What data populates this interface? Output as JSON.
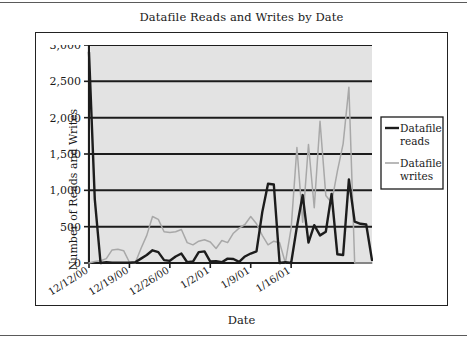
{
  "chart_data": {
    "type": "line",
    "title": "Datafile Reads and Writes by Date",
    "xlabel": "Date",
    "ylabel": "Number of Reads and Writes",
    "ylim": [
      0,
      3000
    ],
    "ytick_labels": [
      "0",
      "500",
      "1,000",
      "1,500",
      "2,000",
      "2,500",
      "3,000"
    ],
    "ytick_values": [
      0,
      500,
      1000,
      1500,
      2000,
      2500,
      3000
    ],
    "xtick_labels": [
      "12/12/00",
      "12/19/00",
      "12/26/00",
      "1/2/01",
      "1/9/01",
      "1/16/01"
    ],
    "xtick_indices": [
      0,
      7,
      14,
      21,
      28,
      35
    ],
    "grid": "horizontal",
    "legend_position": "right",
    "plot_background": "#e3e3e3",
    "series": [
      {
        "name": "Datafile reads",
        "color": "#1c1c1c",
        "values": [
          2900,
          880,
          0,
          10,
          5,
          5,
          5,
          5,
          10,
          60,
          110,
          175,
          150,
          40,
          30,
          90,
          130,
          10,
          20,
          150,
          160,
          20,
          25,
          10,
          60,
          55,
          15,
          90,
          130,
          160,
          700,
          1090,
          1080,
          0,
          10,
          0,
          500,
          935,
          280,
          520,
          380,
          430,
          950,
          120,
          110,
          1150,
          570,
          540,
          530,
          40
        ]
      },
      {
        "name": "Datafile writes",
        "color": "#a8a8a8",
        "values": [
          0,
          20,
          30,
          60,
          180,
          190,
          170,
          10,
          0,
          200,
          380,
          640,
          600,
          430,
          420,
          430,
          460,
          280,
          250,
          300,
          320,
          290,
          200,
          310,
          280,
          410,
          480,
          530,
          640,
          540,
          380,
          250,
          300,
          280,
          0,
          480,
          1590,
          560,
          1630,
          760,
          1950,
          930,
          830,
          1260,
          1640,
          2420,
          0,
          0,
          0,
          0
        ]
      }
    ]
  },
  "legend": {
    "items": [
      {
        "label_line1": "Datafile",
        "label_line2": "reads",
        "color": "#1c1c1c"
      },
      {
        "label_line1": "Datafile",
        "label_line2": "writes",
        "color": "#a8a8a8"
      }
    ]
  }
}
